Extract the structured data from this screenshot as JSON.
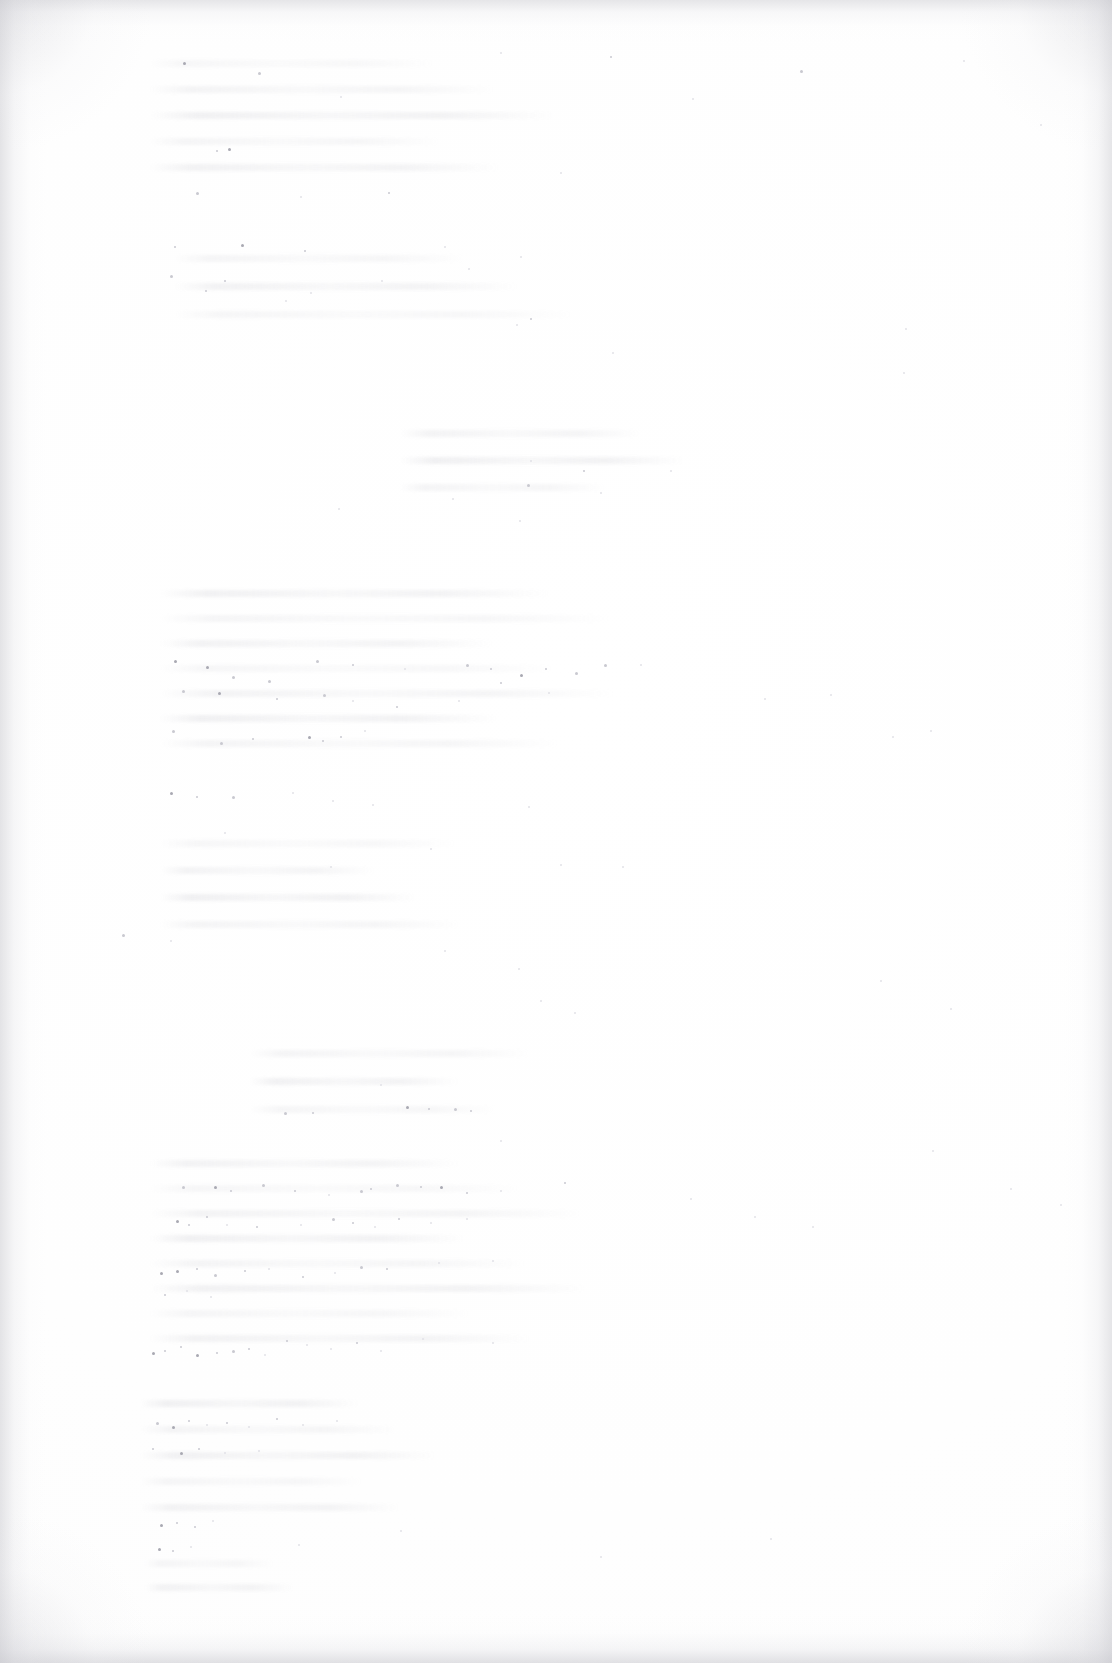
{
  "document": {
    "kind": "scanned-page",
    "title": "",
    "visible_text": "",
    "page_number": "",
    "body_text": "",
    "note": ""
  },
  "appearance": {
    "page_background": "#fefefe",
    "paper_tone": "#ffffff",
    "edge_vignette_color": "#cdcdd2",
    "speckle_color": "#c9c9d0",
    "speckle_color_dark": "#a9a9b2",
    "speckle_color_faint": "#e2e2e7",
    "ghost_line_color": "#c4c4cb"
  },
  "ghost_bands": [
    {
      "top": 60,
      "left": 150,
      "width": 460,
      "lines": 5,
      "gap": 26
    },
    {
      "top": 255,
      "left": 175,
      "width": 420,
      "lines": 3,
      "gap": 28
    },
    {
      "top": 430,
      "left": 400,
      "width": 320,
      "lines": 3,
      "gap": 27
    },
    {
      "top": 590,
      "left": 160,
      "width": 470,
      "lines": 7,
      "gap": 25
    },
    {
      "top": 840,
      "left": 160,
      "width": 330,
      "lines": 4,
      "gap": 27
    },
    {
      "top": 1050,
      "left": 250,
      "width": 290,
      "lines": 3,
      "gap": 28
    },
    {
      "top": 1160,
      "left": 150,
      "width": 470,
      "lines": 8,
      "gap": 25
    },
    {
      "top": 1400,
      "left": 140,
      "width": 300,
      "lines": 5,
      "gap": 26
    },
    {
      "top": 1560,
      "left": 145,
      "width": 160,
      "lines": 2,
      "gap": 24
    }
  ],
  "speckles": [
    [
      183,
      62,
      2,
      "dark"
    ],
    [
      258,
      72,
      2,
      ""
    ],
    [
      228,
      148,
      2,
      "dark"
    ],
    [
      216,
      150,
      1,
      ""
    ],
    [
      340,
      96,
      1,
      "faint"
    ],
    [
      500,
      52,
      1,
      "faint"
    ],
    [
      610,
      56,
      1,
      ""
    ],
    [
      692,
      98,
      1,
      "faint"
    ],
    [
      800,
      70,
      2,
      ""
    ],
    [
      963,
      60,
      1,
      "faint"
    ],
    [
      1040,
      124,
      1,
      "faint"
    ],
    [
      196,
      192,
      2,
      ""
    ],
    [
      300,
      196,
      1,
      "faint"
    ],
    [
      388,
      192,
      1,
      ""
    ],
    [
      560,
      172,
      1,
      "faint"
    ],
    [
      174,
      246,
      1,
      ""
    ],
    [
      241,
      244,
      2,
      "dark"
    ],
    [
      304,
      250,
      1,
      ""
    ],
    [
      444,
      246,
      1,
      "faint"
    ],
    [
      170,
      275,
      2,
      ""
    ],
    [
      224,
      280,
      1,
      ""
    ],
    [
      310,
      292,
      1,
      "faint"
    ],
    [
      381,
      280,
      1,
      "faint"
    ],
    [
      468,
      268,
      1,
      "faint"
    ],
    [
      520,
      256,
      1,
      "faint"
    ],
    [
      612,
      352,
      1,
      "faint"
    ],
    [
      903,
      372,
      1,
      "faint"
    ],
    [
      205,
      290,
      1,
      ""
    ],
    [
      285,
      300,
      1,
      "faint"
    ],
    [
      516,
      324,
      1,
      "faint"
    ],
    [
      530,
      318,
      1,
      ""
    ],
    [
      905,
      328,
      1,
      "faint"
    ],
    [
      527,
      484,
      2,
      ""
    ],
    [
      583,
      470,
      1,
      ""
    ],
    [
      600,
      492,
      1,
      "faint"
    ],
    [
      530,
      460,
      1,
      "faint"
    ],
    [
      452,
      498,
      1,
      "faint"
    ],
    [
      670,
      470,
      1,
      "faint"
    ],
    [
      519,
      520,
      1,
      "faint"
    ],
    [
      338,
      508,
      1,
      "faint"
    ],
    [
      174,
      660,
      2,
      "dark"
    ],
    [
      206,
      666,
      2,
      "dark"
    ],
    [
      232,
      676,
      2,
      ""
    ],
    [
      268,
      680,
      2,
      ""
    ],
    [
      316,
      660,
      2,
      ""
    ],
    [
      352,
      664,
      1,
      ""
    ],
    [
      404,
      668,
      1,
      "faint"
    ],
    [
      466,
      664,
      2,
      ""
    ],
    [
      490,
      668,
      1,
      ""
    ],
    [
      520,
      674,
      2,
      "dark"
    ],
    [
      545,
      668,
      1,
      ""
    ],
    [
      575,
      672,
      2,
      ""
    ],
    [
      604,
      664,
      2,
      ""
    ],
    [
      640,
      664,
      1,
      "faint"
    ],
    [
      182,
      690,
      2,
      ""
    ],
    [
      218,
      692,
      2,
      "dark"
    ],
    [
      276,
      698,
      1,
      ""
    ],
    [
      323,
      694,
      2,
      ""
    ],
    [
      352,
      700,
      1,
      "faint"
    ],
    [
      396,
      706,
      1,
      ""
    ],
    [
      458,
      700,
      1,
      "faint"
    ],
    [
      500,
      682,
      1,
      ""
    ],
    [
      548,
      692,
      1,
      "faint"
    ],
    [
      764,
      698,
      1,
      "faint"
    ],
    [
      830,
      694,
      1,
      "faint"
    ],
    [
      172,
      730,
      2,
      ""
    ],
    [
      220,
      742,
      2,
      ""
    ],
    [
      252,
      738,
      1,
      ""
    ],
    [
      308,
      736,
      2,
      "dark"
    ],
    [
      322,
      740,
      1,
      ""
    ],
    [
      340,
      736,
      1,
      ""
    ],
    [
      364,
      730,
      1,
      "faint"
    ],
    [
      892,
      736,
      1,
      "faint"
    ],
    [
      930,
      730,
      1,
      "faint"
    ],
    [
      170,
      792,
      2,
      "dark"
    ],
    [
      196,
      796,
      1,
      ""
    ],
    [
      232,
      796,
      2,
      ""
    ],
    [
      292,
      792,
      1,
      "faint"
    ],
    [
      332,
      800,
      1,
      "faint"
    ],
    [
      372,
      804,
      1,
      "faint"
    ],
    [
      528,
      806,
      1,
      "faint"
    ],
    [
      224,
      832,
      1,
      "faint"
    ],
    [
      330,
      866,
      1,
      "faint"
    ],
    [
      430,
      848,
      1,
      "faint"
    ],
    [
      560,
      864,
      1,
      "faint"
    ],
    [
      622,
      866,
      1,
      "faint"
    ],
    [
      122,
      934,
      2,
      ""
    ],
    [
      170,
      940,
      1,
      "faint"
    ],
    [
      444,
      950,
      1,
      "faint"
    ],
    [
      518,
      968,
      1,
      "faint"
    ],
    [
      540,
      1000,
      1,
      "faint"
    ],
    [
      574,
      1012,
      1,
      "faint"
    ],
    [
      284,
      1112,
      2,
      ""
    ],
    [
      312,
      1112,
      1,
      ""
    ],
    [
      406,
      1106,
      2,
      "dark"
    ],
    [
      428,
      1108,
      1,
      ""
    ],
    [
      454,
      1108,
      2,
      ""
    ],
    [
      470,
      1110,
      1,
      ""
    ],
    [
      380,
      1084,
      1,
      "faint"
    ],
    [
      500,
      1140,
      1,
      "faint"
    ],
    [
      182,
      1186,
      2,
      ""
    ],
    [
      214,
      1186,
      2,
      "dark"
    ],
    [
      230,
      1190,
      1,
      ""
    ],
    [
      262,
      1184,
      2,
      ""
    ],
    [
      294,
      1190,
      1,
      ""
    ],
    [
      328,
      1194,
      1,
      "faint"
    ],
    [
      360,
      1190,
      2,
      ""
    ],
    [
      370,
      1188,
      1,
      ""
    ],
    [
      396,
      1184,
      2,
      ""
    ],
    [
      420,
      1186,
      1,
      ""
    ],
    [
      440,
      1186,
      2,
      "dark"
    ],
    [
      466,
      1192,
      1,
      ""
    ],
    [
      500,
      1190,
      1,
      "faint"
    ],
    [
      564,
      1182,
      1,
      ""
    ],
    [
      176,
      1220,
      2,
      "dark"
    ],
    [
      188,
      1224,
      1,
      ""
    ],
    [
      206,
      1216,
      1,
      ""
    ],
    [
      226,
      1224,
      1,
      "faint"
    ],
    [
      256,
      1226,
      1,
      ""
    ],
    [
      300,
      1224,
      1,
      "faint"
    ],
    [
      332,
      1218,
      2,
      ""
    ],
    [
      352,
      1222,
      1,
      ""
    ],
    [
      374,
      1226,
      1,
      "faint"
    ],
    [
      398,
      1218,
      1,
      ""
    ],
    [
      430,
      1222,
      1,
      "faint"
    ],
    [
      466,
      1218,
      1,
      "faint"
    ],
    [
      160,
      1272,
      2,
      "dark"
    ],
    [
      176,
      1270,
      2,
      "dark"
    ],
    [
      196,
      1268,
      1,
      ""
    ],
    [
      214,
      1274,
      2,
      ""
    ],
    [
      244,
      1270,
      1,
      ""
    ],
    [
      268,
      1268,
      1,
      "faint"
    ],
    [
      302,
      1276,
      1,
      ""
    ],
    [
      334,
      1272,
      1,
      "faint"
    ],
    [
      360,
      1266,
      2,
      ""
    ],
    [
      386,
      1268,
      1,
      ""
    ],
    [
      164,
      1294,
      1,
      ""
    ],
    [
      186,
      1290,
      1,
      "faint"
    ],
    [
      210,
      1296,
      1,
      "faint"
    ],
    [
      438,
      1262,
      1,
      "faint"
    ],
    [
      492,
      1260,
      1,
      "faint"
    ],
    [
      152,
      1352,
      2,
      "dark"
    ],
    [
      164,
      1350,
      1,
      ""
    ],
    [
      180,
      1346,
      1,
      ""
    ],
    [
      196,
      1354,
      2,
      "dark"
    ],
    [
      216,
      1352,
      1,
      ""
    ],
    [
      232,
      1350,
      2,
      ""
    ],
    [
      248,
      1348,
      1,
      ""
    ],
    [
      264,
      1354,
      1,
      "faint"
    ],
    [
      286,
      1340,
      1,
      ""
    ],
    [
      306,
      1344,
      1,
      "faint"
    ],
    [
      330,
      1348,
      1,
      "faint"
    ],
    [
      356,
      1342,
      1,
      ""
    ],
    [
      380,
      1350,
      1,
      "faint"
    ],
    [
      422,
      1338,
      1,
      "faint"
    ],
    [
      492,
      1342,
      1,
      "faint"
    ],
    [
      156,
      1422,
      2,
      ""
    ],
    [
      172,
      1426,
      2,
      "dark"
    ],
    [
      188,
      1420,
      1,
      ""
    ],
    [
      206,
      1424,
      1,
      "faint"
    ],
    [
      226,
      1422,
      1,
      ""
    ],
    [
      248,
      1426,
      1,
      "faint"
    ],
    [
      276,
      1418,
      1,
      ""
    ],
    [
      302,
      1424,
      1,
      "faint"
    ],
    [
      336,
      1420,
      1,
      "faint"
    ],
    [
      152,
      1448,
      1,
      ""
    ],
    [
      180,
      1452,
      2,
      "dark"
    ],
    [
      198,
      1448,
      1,
      ""
    ],
    [
      224,
      1452,
      1,
      "faint"
    ],
    [
      258,
      1450,
      1,
      "faint"
    ],
    [
      160,
      1524,
      2,
      "dark"
    ],
    [
      176,
      1522,
      1,
      ""
    ],
    [
      194,
      1526,
      1,
      ""
    ],
    [
      212,
      1520,
      1,
      "faint"
    ],
    [
      158,
      1548,
      2,
      "dark"
    ],
    [
      172,
      1550,
      1,
      ""
    ],
    [
      190,
      1546,
      1,
      "faint"
    ],
    [
      298,
      1544,
      1,
      "faint"
    ],
    [
      400,
      1530,
      1,
      "faint"
    ],
    [
      600,
      1556,
      1,
      "faint"
    ],
    [
      770,
      1538,
      1,
      "faint"
    ],
    [
      932,
      1150,
      1,
      "faint"
    ],
    [
      1010,
      1188,
      1,
      "faint"
    ],
    [
      1060,
      1204,
      1,
      "faint"
    ],
    [
      880,
      980,
      1,
      "faint"
    ],
    [
      950,
      1008,
      1,
      "faint"
    ],
    [
      690,
      1198,
      1,
      "faint"
    ],
    [
      754,
      1216,
      1,
      "faint"
    ],
    [
      812,
      1226,
      1,
      "faint"
    ]
  ]
}
